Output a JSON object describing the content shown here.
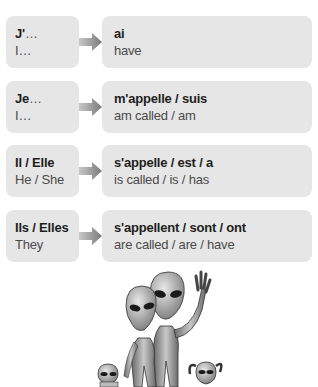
{
  "rows": [
    {
      "subject_fr": "J'",
      "subject_suffix": "…",
      "subject_en": "I…",
      "verb_fr": "ai",
      "verb_en": "have"
    },
    {
      "subject_fr": "Je",
      "subject_suffix": "…",
      "subject_en": "I…",
      "verb_fr": "m'appelle / suis",
      "verb_en": "am called / am"
    },
    {
      "subject_fr": "Il / Elle",
      "subject_suffix": "",
      "subject_en": "He / She",
      "verb_fr": "s'appelle / est / a",
      "verb_en": "is called / is / has"
    },
    {
      "subject_fr": "Ils / Elles",
      "subject_suffix": "",
      "subject_en": "They",
      "verb_fr": "s'appellent / sont / ont",
      "verb_en": "are called / are / have"
    }
  ],
  "illustration": {
    "icon": "alien-family-illustration"
  },
  "colors": {
    "box_bg": "#e6e6e6",
    "arrow": "#8a8a8a"
  }
}
